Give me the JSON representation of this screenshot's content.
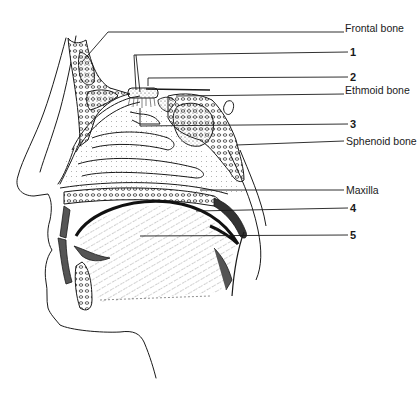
{
  "diagram": {
    "labels": [
      {
        "id": "frontal",
        "text": "Frontal bone",
        "x": 345,
        "y": 21,
        "bold": false
      },
      {
        "id": "n1",
        "text": "1",
        "x": 350,
        "y": 46,
        "bold": true
      },
      {
        "id": "n2",
        "text": "2",
        "x": 350,
        "y": 71,
        "bold": true
      },
      {
        "id": "ethmoid",
        "text": "Ethmoid bone",
        "x": 345,
        "y": 84,
        "bold": false
      },
      {
        "id": "n3",
        "text": "3",
        "x": 350,
        "y": 117,
        "bold": true
      },
      {
        "id": "sphenoid",
        "text": "Sphenoid bone",
        "x": 346,
        "y": 135,
        "bold": false
      },
      {
        "id": "maxilla",
        "text": "Maxilla",
        "x": 346,
        "y": 178,
        "bold": false
      },
      {
        "id": "n4",
        "text": "4",
        "x": 350,
        "y": 202,
        "bold": true
      },
      {
        "id": "n5",
        "text": "5",
        "x": 350,
        "y": 229,
        "bold": true
      }
    ]
  },
  "colors": {
    "ink": "#1a1a1a",
    "background": "#ffffff",
    "stipple": "#555555"
  }
}
